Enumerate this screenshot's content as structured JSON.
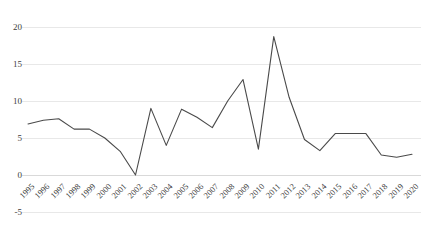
{
  "chart_data": {
    "type": "line",
    "title": "",
    "subtitle": "",
    "xlabel": "",
    "ylabel": "",
    "categories": [
      "1995",
      "1996",
      "1997",
      "1998",
      "1999",
      "2000",
      "2001",
      "2002",
      "2003",
      "2004",
      "2005",
      "2006",
      "2007",
      "2008",
      "2009",
      "2010",
      "2011",
      "2012",
      "2013",
      "2014",
      "2015",
      "2016",
      "2017",
      "2018",
      "2019",
      "2020"
    ],
    "values": [
      6.9,
      7.4,
      7.6,
      6.2,
      6.2,
      5.0,
      3.2,
      0.0,
      9.0,
      4.0,
      8.9,
      7.8,
      6.4,
      10.0,
      12.9,
      3.5,
      18.7,
      10.5,
      4.8,
      3.3,
      5.6,
      5.6,
      5.6,
      2.7,
      2.4,
      2.8
    ],
    "ylim": [
      -5,
      20
    ],
    "yticks": [
      20,
      15,
      10,
      5,
      0,
      -5
    ],
    "ytick_labels": [
      "20",
      "15",
      "10",
      "5",
      "0",
      "-5"
    ],
    "xlim": [
      "1995",
      "2020"
    ],
    "grid": true,
    "grid_axis": "y",
    "legend": false,
    "legend_position": "none",
    "series_color": "#4a4a4a",
    "grid_color": "#e8e8e8",
    "background_color": "#ffffff",
    "annotations": []
  },
  "axes": {
    "y_axis_name": "value-axis",
    "x_axis_name": "year-axis"
  }
}
